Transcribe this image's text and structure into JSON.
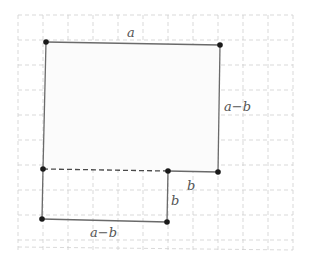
{
  "diagram": {
    "type": "geometry-figure",
    "grid": {
      "x_start": 18,
      "y_start": 15,
      "spacing": 25,
      "cols": 11,
      "rows": 9
    },
    "vertices": [
      {
        "id": "P1",
        "x": 46,
        "y": 42
      },
      {
        "id": "P2",
        "x": 220,
        "y": 45
      },
      {
        "id": "P3",
        "x": 43,
        "y": 169
      },
      {
        "id": "P4",
        "x": 168,
        "y": 171
      },
      {
        "id": "P5",
        "x": 218,
        "y": 172
      },
      {
        "id": "P6",
        "x": 42,
        "y": 219
      },
      {
        "id": "P7",
        "x": 167,
        "y": 222
      }
    ],
    "edges": [
      {
        "from": "P1",
        "to": "P2",
        "style": "solid"
      },
      {
        "from": "P1",
        "to": "P3",
        "style": "solid"
      },
      {
        "from": "P2",
        "to": "P5",
        "style": "solid"
      },
      {
        "from": "P4",
        "to": "P5",
        "style": "solid"
      },
      {
        "from": "P3",
        "to": "P4",
        "style": "dashed"
      },
      {
        "from": "P3",
        "to": "P6",
        "style": "solid"
      },
      {
        "from": "P4",
        "to": "P7",
        "style": "solid"
      },
      {
        "from": "P6",
        "to": "P7",
        "style": "solid"
      }
    ],
    "labels": {
      "top": {
        "text": "a",
        "x": 127,
        "y": 37
      },
      "right": {
        "text": "a−b",
        "x": 224,
        "y": 111
      },
      "inner_bottom": {
        "text": "b",
        "x": 187,
        "y": 190
      },
      "inner_side": {
        "text": "b",
        "x": 171,
        "y": 205
      },
      "bottom": {
        "text": "a−b",
        "x": 90,
        "y": 237
      }
    }
  }
}
